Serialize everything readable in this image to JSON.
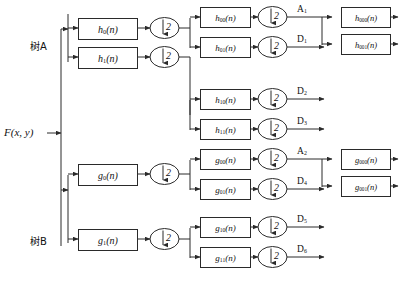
{
  "diagram": {
    "input": {
      "label": "F(x,  y)",
      "name": "input-signal"
    },
    "trees": [
      {
        "id": "A",
        "label": "树A"
      },
      {
        "id": "B",
        "label": "树B"
      }
    ],
    "downsample": {
      "factor": "2",
      "arrow": "↓"
    },
    "stage1": [
      {
        "label": "h",
        "sub": "0",
        "suffix": "(n)"
      },
      {
        "label": "h",
        "sub": "1",
        "suffix": "(n)"
      },
      {
        "label": "g",
        "sub": "0",
        "suffix": "(n)"
      },
      {
        "label": "g",
        "sub": "1",
        "suffix": "(n)"
      }
    ],
    "stage2": [
      {
        "label": "h",
        "sub": "00",
        "suffix": "(n)"
      },
      {
        "label": "h",
        "sub": "01",
        "suffix": "(n)"
      },
      {
        "label": "h",
        "sub": "10",
        "suffix": "(n)"
      },
      {
        "label": "h",
        "sub": "11",
        "suffix": "(n)"
      },
      {
        "label": "g",
        "sub": "00",
        "suffix": "(n)"
      },
      {
        "label": "g",
        "sub": "01",
        "suffix": "(n)"
      },
      {
        "label": "g",
        "sub": "10",
        "suffix": "(n)"
      },
      {
        "label": "g",
        "sub": "11",
        "suffix": "(n)"
      }
    ],
    "stage3": [
      {
        "label": "h",
        "sub": "000",
        "suffix": "(n)"
      },
      {
        "label": "h",
        "sub": "001",
        "suffix": "(n)"
      },
      {
        "label": "g",
        "sub": "000",
        "suffix": "(n)"
      },
      {
        "label": "g",
        "sub": "001",
        "suffix": "(n)"
      }
    ],
    "outputs": [
      {
        "label": "A",
        "sub": "1"
      },
      {
        "label": "D",
        "sub": "1"
      },
      {
        "label": "D",
        "sub": "2"
      },
      {
        "label": "D",
        "sub": "3"
      },
      {
        "label": "A",
        "sub": "2"
      },
      {
        "label": "D",
        "sub": "4"
      },
      {
        "label": "D",
        "sub": "5"
      },
      {
        "label": "D",
        "sub": "6"
      }
    ],
    "colors": {
      "line": "#2a2a2a",
      "text": "#111111",
      "background": "#ffffff"
    }
  }
}
